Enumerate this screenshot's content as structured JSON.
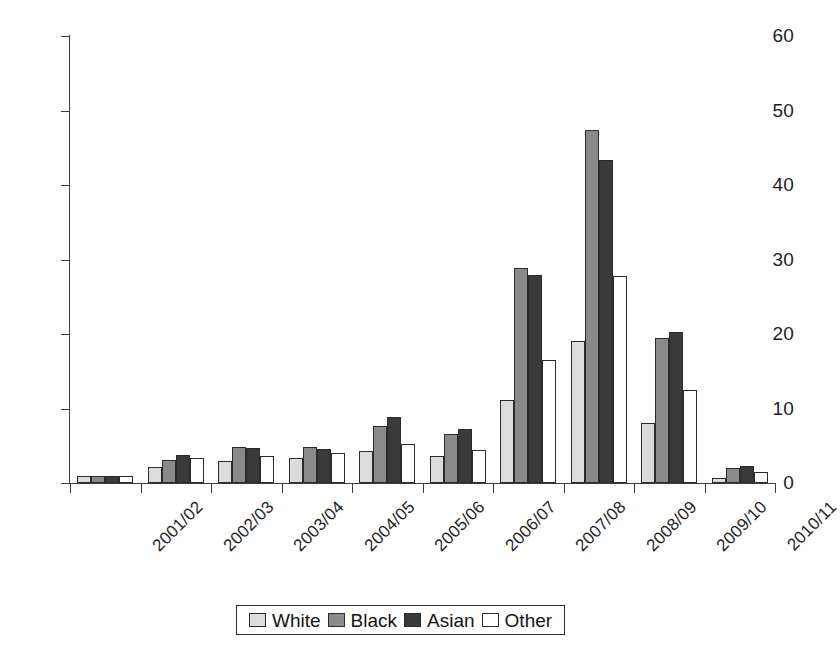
{
  "chart_data": {
    "type": "bar",
    "title": "",
    "subtitle": "",
    "xlabel": "",
    "ylabel": "",
    "ylim": [
      0,
      60
    ],
    "yticks": [
      0,
      10,
      20,
      30,
      40,
      50,
      60
    ],
    "grid": false,
    "legend_position": "bottom",
    "categories": [
      "2001/02",
      "2002/03",
      "2003/04",
      "2004/05",
      "2005/06",
      "2006/07",
      "2007/08",
      "2008/09",
      "2009/10",
      "2010/11"
    ],
    "series": [
      {
        "name": "White",
        "color": "#dcdcdc",
        "values": [
          1.0,
          2.2,
          2.9,
          3.4,
          4.3,
          3.6,
          11.1,
          19.0,
          8.0,
          0.7
        ]
      },
      {
        "name": "Black",
        "color": "#8a8a8a",
        "values": [
          1.0,
          3.1,
          4.9,
          4.8,
          7.6,
          6.6,
          28.8,
          47.4,
          19.4,
          2.0
        ]
      },
      {
        "name": "Asian",
        "color": "#3a3a3a",
        "values": [
          1.0,
          3.7,
          4.7,
          4.6,
          8.8,
          7.2,
          27.9,
          43.3,
          20.3,
          2.3
        ]
      },
      {
        "name": "Other",
        "color": "#ffffff",
        "values": [
          1.0,
          3.4,
          3.6,
          4.0,
          5.2,
          4.4,
          16.5,
          27.8,
          12.5,
          1.5
        ]
      }
    ],
    "legend": [
      "White",
      "Black",
      "Asian",
      "Other"
    ]
  }
}
